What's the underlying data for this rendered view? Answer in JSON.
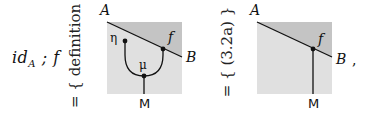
{
  "equation": {
    "lhs": {
      "base": "id",
      "subscript": "A",
      "rest": " ; f"
    },
    "steps": [
      {
        "relation": "=",
        "hint": "{ definition }"
      },
      {
        "relation": "=",
        "hint": "{ (3.2a) }"
      }
    ],
    "trailing_punctuation": ","
  },
  "diagrams": [
    {
      "name": "left-string-diagram",
      "labels": {
        "top_left": "A",
        "region": "f",
        "right": "B",
        "bottom": "M",
        "unit": "η",
        "mult": "μ"
      },
      "colors": {
        "light_region": "#e0e0e0",
        "dark_region": "#c4c4c4",
        "wire": "#111111"
      }
    },
    {
      "name": "right-string-diagram",
      "labels": {
        "top_left": "A",
        "region": "f",
        "right": "B",
        "bottom": "M"
      },
      "colors": {
        "light_region": "#e0e0e0",
        "dark_region": "#c4c4c4",
        "wire": "#111111"
      }
    }
  ]
}
